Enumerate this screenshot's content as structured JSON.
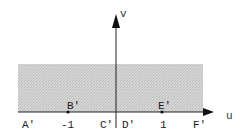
{
  "diagram": {
    "type": "complex-plane-mapping",
    "axes": {
      "horizontal_label": "u",
      "vertical_label": "v"
    },
    "region": {
      "description": "upper half-plane (shaded)",
      "fill_color": "#cfcfcf"
    },
    "points": [
      {
        "id": "B'",
        "label": "B'",
        "value": -1,
        "on_axis": true
      },
      {
        "id": "E'",
        "label": "E'",
        "value": 1,
        "on_axis": true
      }
    ],
    "below_axis_labels": [
      {
        "id": "A'",
        "text": "A'"
      },
      {
        "id": "tick-neg1",
        "text": "-1"
      },
      {
        "id": "C'",
        "text": "C'"
      },
      {
        "id": "D'",
        "text": "D'"
      },
      {
        "id": "tick-1",
        "text": "1"
      },
      {
        "id": "F'",
        "text": "F'"
      }
    ],
    "colors": {
      "axis": "#222222",
      "shade": "#cfcfcf",
      "text": "#1a1a1a"
    }
  }
}
